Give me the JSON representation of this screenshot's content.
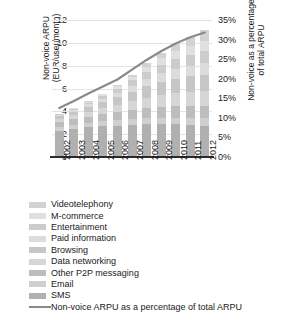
{
  "chart_data": {
    "type": "bar",
    "subtype": "stacked-bar-with-line-overlay",
    "title": "",
    "xlabel": "",
    "ylabel": "Non-voice ARPU (EUR/user/month)",
    "y2label": "Non-voice as a percentage of total ARPU",
    "ylim": [
      0,
      12
    ],
    "y2lim": [
      0,
      35
    ],
    "grid": true,
    "legend_position": "below",
    "categories": [
      "2002",
      "2003",
      "2004",
      "2005",
      "2006",
      "2007",
      "2008",
      "2009",
      "2010",
      "2011",
      "2012"
    ],
    "ytick_labels": [
      "0",
      "2",
      "4",
      "6",
      "8",
      "10",
      "12"
    ],
    "ytick_values": [
      0,
      2,
      4,
      6,
      8,
      10,
      12
    ],
    "y2tick_labels": [
      "0%",
      "5%",
      "10%",
      "15%",
      "20%",
      "25%",
      "30%",
      "35%"
    ],
    "y2tick_values": [
      0,
      5,
      10,
      15,
      20,
      25,
      30,
      35
    ],
    "series": [
      {
        "name": "SMS",
        "color": "#b0b0b0",
        "values": [
          2.3,
          2.45,
          2.6,
          2.7,
          2.75,
          2.8,
          2.85,
          2.85,
          2.85,
          2.8,
          2.75
        ]
      },
      {
        "name": "Email",
        "color": "#cfcfcf",
        "values": [
          0.3,
          0.34,
          0.38,
          0.42,
          0.46,
          0.5,
          0.55,
          0.58,
          0.6,
          0.62,
          0.64
        ]
      },
      {
        "name": "Other P2P messaging",
        "color": "#bdbdbd",
        "values": [
          0.45,
          0.5,
          0.56,
          0.62,
          0.7,
          0.78,
          0.86,
          0.92,
          0.98,
          1.02,
          1.06
        ]
      },
      {
        "name": "Data networking",
        "color": "#d6d6d6",
        "values": [
          0.3,
          0.36,
          0.44,
          0.54,
          0.66,
          0.8,
          0.95,
          1.08,
          1.18,
          1.26,
          1.32
        ]
      },
      {
        "name": "Browsing",
        "color": "#c6c6c6",
        "values": [
          0.25,
          0.32,
          0.42,
          0.54,
          0.68,
          0.84,
          1.0,
          1.14,
          1.26,
          1.36,
          1.44
        ]
      },
      {
        "name": "Paid information",
        "color": "#dcdcdc",
        "values": [
          0.12,
          0.16,
          0.22,
          0.3,
          0.4,
          0.52,
          0.64,
          0.76,
          0.86,
          0.94,
          1.0
        ]
      },
      {
        "name": "Entertainment",
        "color": "#cccccc",
        "values": [
          0.06,
          0.1,
          0.16,
          0.24,
          0.35,
          0.48,
          0.62,
          0.76,
          0.88,
          0.98,
          1.06
        ]
      },
      {
        "name": "M-commerce",
        "color": "#e0e0e0",
        "values": [
          0.02,
          0.04,
          0.08,
          0.14,
          0.22,
          0.32,
          0.44,
          0.56,
          0.68,
          0.78,
          0.86
        ]
      },
      {
        "name": "Videotelephony",
        "color": "#d2d2d2",
        "values": [
          0.0,
          0.01,
          0.02,
          0.05,
          0.1,
          0.18,
          0.3,
          0.45,
          0.62,
          0.8,
          0.97
        ]
      }
    ],
    "totals": [
      3.8,
      4.28,
      4.88,
      5.55,
      6.32,
      7.22,
      8.21,
      9.1,
      9.91,
      10.56,
      11.1
    ],
    "line_series": {
      "name": "Non-voice ARPU as a percentage of total ARPU",
      "color": "#8a8a8a",
      "axis": "right",
      "unit": "%",
      "values": [
        12.5,
        14.3,
        16.2,
        18.0,
        19.8,
        22.3,
        24.8,
        27.0,
        29.0,
        30.6,
        31.8
      ]
    }
  },
  "axes": {
    "left_title_line1": "Non-voice ARPU",
    "left_title_line2": "(EUR/user/month)",
    "right_title_line1": "Non-voice as a percentage",
    "right_title_line2": "of total ARPU"
  },
  "legend": {
    "items": [
      {
        "label": "Videotelephony",
        "swatch": "#d2d2d2"
      },
      {
        "label": "M-commerce",
        "swatch": "#e0e0e0"
      },
      {
        "label": "Entertainment",
        "swatch": "#cccccc"
      },
      {
        "label": "Paid information",
        "swatch": "#dcdcdc"
      },
      {
        "label": "Browsing",
        "swatch": "#c6c6c6"
      },
      {
        "label": "Data networking",
        "swatch": "#d6d6d6"
      },
      {
        "label": "Other P2P messaging",
        "swatch": "#bdbdbd"
      },
      {
        "label": "Email",
        "swatch": "#cfcfcf"
      },
      {
        "label": "SMS",
        "swatch": "#b0b0b0"
      }
    ],
    "line_item": {
      "label": "Non-voice ARPU as a percentage of total ARPU",
      "color": "#8a8a8a"
    }
  }
}
